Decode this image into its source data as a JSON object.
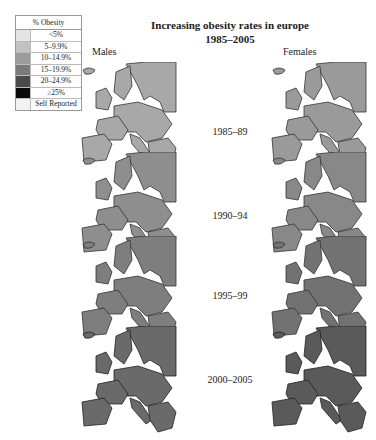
{
  "title": {
    "line1": "Increasing obesity rates in europe",
    "line2": "1985–2005"
  },
  "legend": {
    "header": "% Obesity",
    "items": [
      {
        "label": "<5%",
        "color": "#e4e4e4"
      },
      {
        "label": "5–9.9%",
        "color": "#c2c2c2"
      },
      {
        "label": "10–14.9%",
        "color": "#9c9c9c"
      },
      {
        "label": "15–19.9%",
        "color": "#7a7a7a"
      },
      {
        "label": "20–24.9%",
        "color": "#4a4a4a"
      },
      {
        "label": "≥25%",
        "color": "#0a0a0a"
      },
      {
        "label": "Self Reported",
        "color": "#f2f2f2"
      }
    ]
  },
  "columns": {
    "males": "Males",
    "females": "Females"
  },
  "periods": [
    "1985–89",
    "1990–94",
    "1995–99",
    "2000–2005"
  ]
}
